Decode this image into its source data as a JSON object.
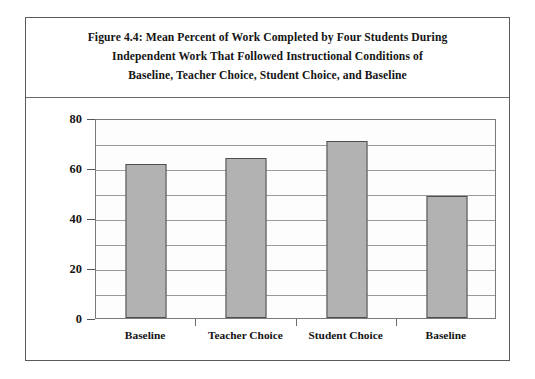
{
  "figure": {
    "title": "Figure 4.4: Mean Percent of Work Completed by Four Students During\nIndependent Work That Followed Instructional Conditions of\nBaseline, Teacher Choice, Student Choice, and Baseline"
  },
  "colors": {
    "bar_fill": "#b2b2b2",
    "bar_border": "#4e4e4e",
    "gridline": "#9a9a9a",
    "plot_background": "#fdfdfd",
    "frame_border": "#5a5a5a",
    "text": "#141414"
  },
  "chart_data": {
    "type": "bar",
    "title": "Figure 4.4: Mean Percent of Work Completed by Four Students During Independent Work That Followed Instructional Conditions of Baseline, Teacher Choice, Student Choice, and Baseline",
    "categories": [
      "Baseline",
      "Teacher Choice",
      "Student Choice",
      "Baseline"
    ],
    "values": [
      61.6,
      64,
      70.8,
      48.8
    ],
    "xlabel": "",
    "ylabel": "Percent of Work Completed",
    "ylim": [
      0,
      80
    ],
    "ytick_labels": [
      "0",
      "20",
      "40",
      "60",
      "80"
    ],
    "ytick_values": [
      0,
      20,
      40,
      60,
      80
    ],
    "minor_gridline_interval": 10,
    "grid": true,
    "legend": false
  }
}
